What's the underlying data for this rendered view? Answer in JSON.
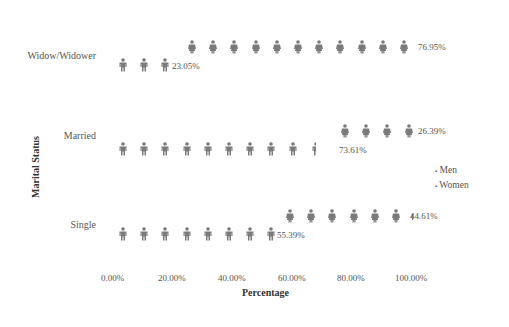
{
  "chart_data": {
    "type": "pictograph",
    "title": "",
    "xlabel": "Percentage",
    "ylabel": "Marital Status",
    "xticks": [
      "0.00%",
      "20.00%",
      "40.00%",
      "60.00%",
      "80.00%",
      "100.00%"
    ],
    "xlim": [
      0,
      100
    ],
    "categories": [
      "Widow/Widower",
      "Married",
      "Single"
    ],
    "series": [
      {
        "name": "Men",
        "values": [
          23.05,
          73.61,
          55.39
        ],
        "labels": [
          "23.05%",
          "73.61%",
          "55.39%"
        ]
      },
      {
        "name": "Women",
        "values": [
          76.95,
          26.39,
          44.61
        ],
        "labels": [
          "76.95%",
          "26.39%",
          "44.61%"
        ]
      }
    ],
    "legend": {
      "position": "right",
      "entries": [
        "Men",
        "Women"
      ]
    },
    "colors": {
      "icon": "#7a7a7a"
    },
    "grid": false
  },
  "rows": [
    {
      "label": "Widow/Widower",
      "men_label": "23.05%",
      "women_label": "76.95%"
    },
    {
      "label": "Married",
      "men_label": "73.61%",
      "women_label": "26.39%"
    },
    {
      "label": "Single",
      "men_label": "55.39%",
      "women_label": "44.61%"
    }
  ],
  "axis": {
    "x_title": "Percentage",
    "y_title": "Marital Status",
    "ticks": [
      "0.00%",
      "20.00%",
      "40.00%",
      "60.00%",
      "80.00%",
      "100.00%"
    ]
  },
  "legend": {
    "men": "Men",
    "women": "Women"
  }
}
